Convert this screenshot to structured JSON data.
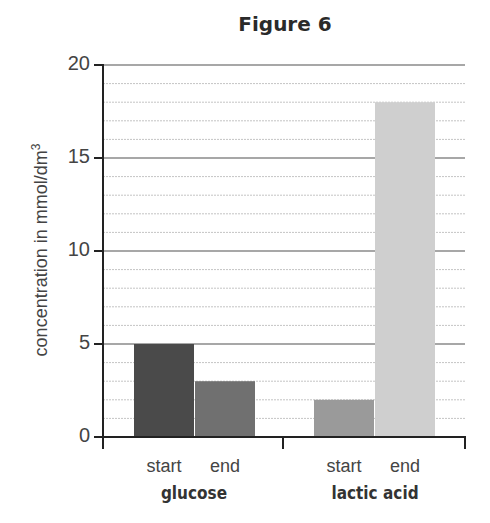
{
  "chart_data": {
    "type": "bar",
    "title": "Figure 6",
    "xlabel": "",
    "ylabel": "concentration in mmol/dm",
    "ylabel_superscript": "3",
    "ylim": [
      0,
      20
    ],
    "yticks": [
      "0",
      "5",
      "10",
      "15",
      "20"
    ],
    "grid": true,
    "grid_minor_step": 1,
    "grid_major_step": 5,
    "legend": "none",
    "groups": [
      {
        "name": "glucose",
        "categories": [
          "start",
          "end"
        ],
        "values": [
          5,
          3
        ],
        "colors": [
          "#4a4a4a",
          "#707070"
        ]
      },
      {
        "name": "lactic acid",
        "categories": [
          "start",
          "end"
        ],
        "values": [
          2,
          18
        ],
        "colors": [
          "#9a9a9a",
          "#cfcfcf"
        ]
      }
    ]
  }
}
